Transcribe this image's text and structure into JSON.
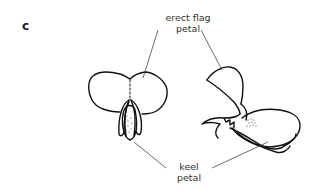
{
  "figure": {
    "panel_letter": "c",
    "labels": {
      "flag": {
        "line1": "erect flag",
        "line2": "petal"
      },
      "keel": {
        "line1": "keel",
        "line2": "petal"
      }
    },
    "colors": {
      "ink": "#111111",
      "leader": "#444444",
      "text": "#333333",
      "background": "#ffffff"
    }
  }
}
